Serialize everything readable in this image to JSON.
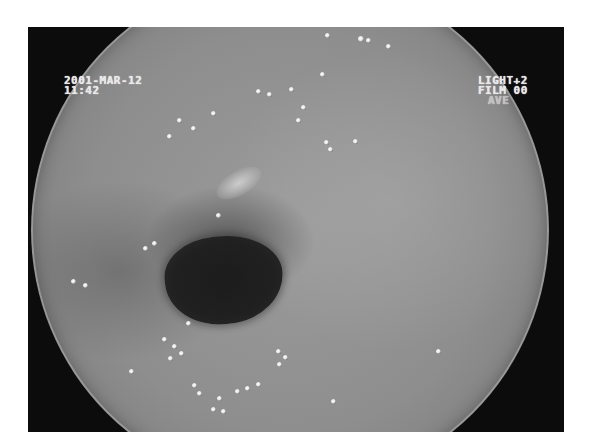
{
  "image": {
    "description": "Endoscopic view of gastrointestinal lumen with mucosa and air bubbles",
    "frame_color": "#0c0c0c",
    "mucosa_color": "#8e8e8e",
    "lumen_color": "#1c1c1c"
  },
  "overlay": {
    "date": "2001-MAR-12",
    "time": "11:42",
    "light": "LIGHT+2",
    "film": "FILM 00",
    "mode": "AVE"
  }
}
